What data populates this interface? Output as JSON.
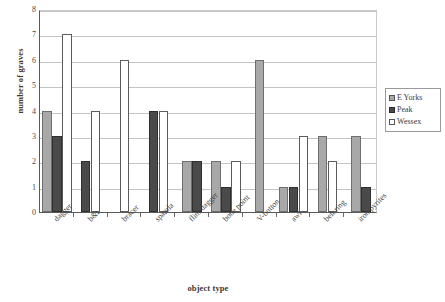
{
  "chart_data": {
    "type": "bar",
    "title": "",
    "xlabel": "object type",
    "ylabel": "number of graves",
    "categories": [
      "dagger",
      "b&t",
      "bracer",
      "spatula",
      "flint dagger",
      "bone point",
      "V-button",
      "awl",
      "belt ring",
      "iron pyrites"
    ],
    "series": [
      {
        "name": "E Yorks",
        "color": "#a8a8a8",
        "values": [
          4,
          0,
          0,
          0,
          2,
          2,
          6,
          1,
          3,
          3
        ]
      },
      {
        "name": "Peak",
        "color": "#4a4a4a",
        "values": [
          3,
          2,
          0,
          4,
          2,
          1,
          0,
          1,
          0,
          1
        ]
      },
      {
        "name": "Wessex",
        "color": "#ffffff",
        "values": [
          7,
          4,
          6,
          4,
          0,
          2,
          0,
          3,
          2,
          0
        ]
      }
    ],
    "ylim": [
      0,
      8
    ],
    "yticks": [
      0,
      1,
      2,
      3,
      4,
      5,
      6,
      7,
      8
    ],
    "ytick_labels": [
      "0",
      "1",
      "2",
      "3",
      "4",
      "5",
      "6",
      "7",
      "8"
    ],
    "grid": true,
    "legend_position": "right",
    "legend_entries": [
      "E Yorks",
      "Peak",
      "Wessex"
    ]
  },
  "legend": {
    "items": [
      {
        "label": "E Yorks"
      },
      {
        "label": "Peak"
      },
      {
        "label": "Wessex"
      }
    ]
  },
  "axes": {
    "y_title": "number of graves",
    "x_title": "object type"
  }
}
